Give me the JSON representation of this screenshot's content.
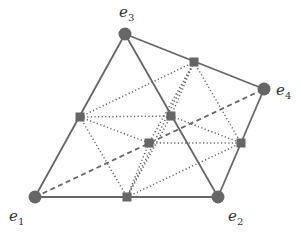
{
  "diagram": {
    "colors": {
      "stroke": "#666666",
      "node_fill": "#666666",
      "label": "#333333",
      "background": "#ffffff"
    },
    "vertices": [
      {
        "id": "e1",
        "label": "e",
        "sub": "1",
        "x": 35,
        "y": 197,
        "lx": 9,
        "ly": 221
      },
      {
        "id": "e2",
        "label": "e",
        "sub": "2",
        "x": 218,
        "y": 197,
        "lx": 228,
        "ly": 221
      },
      {
        "id": "e3",
        "label": "e",
        "sub": "3",
        "x": 125,
        "y": 34,
        "lx": 119,
        "ly": 17
      },
      {
        "id": "e4",
        "label": "e",
        "sub": "4",
        "x": 264,
        "y": 89,
        "lx": 276,
        "ly": 95
      }
    ],
    "midpoints": [
      {
        "id": "m13",
        "x": 80,
        "y": 117
      },
      {
        "id": "m34",
        "x": 194,
        "y": 62
      },
      {
        "id": "m42",
        "x": 241,
        "y": 143
      },
      {
        "id": "m12",
        "x": 127,
        "y": 197
      },
      {
        "id": "m32",
        "x": 171,
        "y": 116
      },
      {
        "id": "m14",
        "x": 149,
        "y": 143
      }
    ],
    "solid_edges": [
      [
        "e1",
        "e3"
      ],
      [
        "e1",
        "e2"
      ],
      [
        "e3",
        "e2"
      ],
      [
        "e3",
        "e4"
      ],
      [
        "e4",
        "e2"
      ]
    ],
    "dashed_edges": [
      [
        "e1",
        "e4"
      ]
    ],
    "dotted_edges": [
      [
        "m13",
        "m32"
      ],
      [
        "m13",
        "m14"
      ],
      [
        "m13",
        "m12"
      ],
      [
        "m13",
        "m34"
      ],
      [
        "m34",
        "m32"
      ],
      [
        "m34",
        "m14"
      ],
      [
        "m34",
        "m42"
      ],
      [
        "m34",
        "m12"
      ],
      [
        "m32",
        "m42"
      ],
      [
        "m32",
        "m12"
      ],
      [
        "m14",
        "m42"
      ],
      [
        "m14",
        "m12"
      ],
      [
        "m12",
        "m42"
      ]
    ]
  }
}
